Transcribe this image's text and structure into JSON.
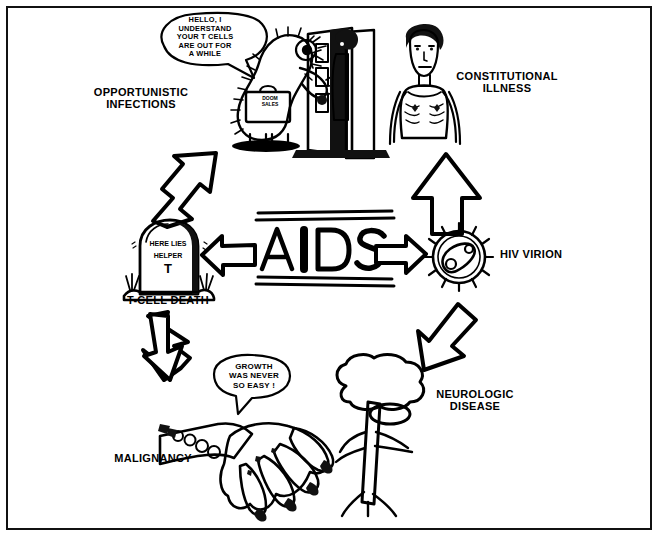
{
  "diagram": {
    "center_label": "AIDS",
    "frame_color": "#111111",
    "ink_color": "#000000",
    "background": "#ffffff"
  },
  "nodes": {
    "opportunistic_infections": {
      "label": "OPPORTUNISTIC\nINFECTIONS",
      "speech_bubble": "HELLO, I\nUNDERSTAND\nYOUR T CELLS\nARE OUT FOR\nA WHILE",
      "briefcase_text": "DOOM\nSALES",
      "icon": "salesman-at-door-icon"
    },
    "constitutional_illness": {
      "label": "CONSTITUTIONAL\nILLNESS",
      "icon": "emaciated-person-icon"
    },
    "hiv_virion": {
      "label": "HIV VIRION",
      "icon": "virus-particle-icon"
    },
    "neurologic_disease": {
      "label": "NEUROLOGIC\nDISEASE",
      "icon": "brain-spinal-cord-icon"
    },
    "malignancy": {
      "label": "MALIGNANCY",
      "speech_bubble": "GROWTH\nWAS NEVER\nSO EASY !",
      "icon": "hand-with-lesions-icon"
    },
    "t_cell_death": {
      "label": "T-CELL DEATH",
      "tombstone_line1": "HERE LIES",
      "tombstone_line2": "HELPER",
      "tombstone_line3": "T",
      "icon": "tombstone-icon"
    }
  },
  "arrows": [
    {
      "name": "arrow-to-opportunistic-infections",
      "style": "solid",
      "direction": "up-right"
    },
    {
      "name": "arrow-to-t-cell-death",
      "style": "hollow",
      "direction": "left"
    },
    {
      "name": "arrow-to-hiv-virion",
      "style": "hollow",
      "direction": "right"
    },
    {
      "name": "arrow-to-constitutional-illness",
      "style": "solid",
      "direction": "up"
    },
    {
      "name": "arrow-to-neurologic-disease",
      "style": "solid",
      "direction": "down-right"
    },
    {
      "name": "arrow-to-malignancy",
      "style": "solid",
      "direction": "down-left"
    }
  ]
}
